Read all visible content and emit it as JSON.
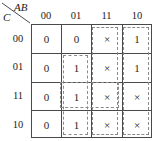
{
  "header": {
    "col_var": "AB",
    "row_var": "C",
    "diagonal_icon": "diagonal-divider-icon"
  },
  "columns": [
    "00",
    "01",
    "11",
    "10"
  ],
  "rows": [
    "00",
    "01",
    "11",
    "10"
  ],
  "cells": [
    [
      "0",
      "0",
      "×",
      "1"
    ],
    [
      "0",
      "1",
      "×",
      "1"
    ],
    [
      "0",
      "1",
      "×",
      "×"
    ],
    [
      "0",
      "1",
      "×",
      "×"
    ]
  ],
  "groups": [
    {
      "name": "group-col-11",
      "col_start": 2,
      "col_span": 1,
      "row_start": 0,
      "row_span": 4
    },
    {
      "name": "group-col-10",
      "col_start": 3,
      "col_span": 1,
      "row_start": 0,
      "row_span": 4
    },
    {
      "name": "group-col-01",
      "col_start": 1,
      "col_span": 1,
      "row_start": 1,
      "row_span": 3
    },
    {
      "name": "group-row-11",
      "col_start": 1,
      "col_span": 2,
      "row_start": 2,
      "row_span": 1
    }
  ],
  "colors": {
    "grid_line": "#4a4a4a",
    "group_dash": "#8a8a8a",
    "text": "#262626",
    "background": "#ffffff"
  }
}
